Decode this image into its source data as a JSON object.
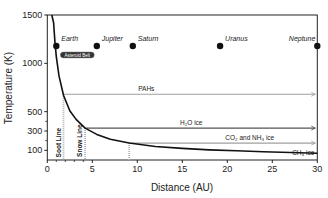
{
  "chart_data": {
    "type": "line",
    "title": "",
    "xlabel": "Distance (AU)",
    "ylabel": "Temperature (K)",
    "xlim": [
      0,
      30
    ],
    "ylim": [
      0,
      1500
    ],
    "x_ticks": [
      0,
      5,
      10,
      15,
      20,
      25,
      30
    ],
    "y_ticks": [
      100,
      300,
      500,
      1000,
      1500
    ],
    "y_tick_labels": [
      "100",
      "300",
      "500",
      "1000",
      "1500"
    ],
    "x_tick_labels": [
      "0",
      "5",
      "10",
      "15",
      "20",
      "25",
      "30"
    ],
    "grid": false,
    "series": [
      {
        "name": "Disk temperature profile",
        "x": [
          0.7,
          0.85,
          1,
          1.3,
          1.8,
          2.5,
          3.2,
          4.2,
          5.5,
          7,
          9.1,
          12,
          15,
          18,
          21,
          24,
          27,
          30
        ],
        "y": [
          1420,
          1220,
          1070,
          870,
          670,
          510,
          420,
          330,
          265,
          215,
          175,
          140,
          120,
          105,
          95,
          85,
          77,
          70
        ]
      }
    ],
    "planets": [
      {
        "name": "Earth",
        "distance": 1.0,
        "temperature": 1180
      },
      {
        "name": "Jupiter",
        "distance": 5.5,
        "temperature": 1180
      },
      {
        "name": "Saturn",
        "distance": 9.5,
        "temperature": 1180
      },
      {
        "name": "Uranus",
        "distance": 19.2,
        "temperature": 1180
      },
      {
        "name": "Neptune",
        "distance": 30.0,
        "temperature": 1180
      }
    ],
    "asteroid_belt_label": "Asteroid Belt",
    "condensation_zones": [
      {
        "label": "PAHs",
        "start_distance": 1.8,
        "temperature": 680,
        "color": "#a0a0a0"
      },
      {
        "label": "H₂O ice",
        "start_distance": 4.2,
        "temperature": 330,
        "color": "#555555"
      },
      {
        "label": "CO₂ and NH₃ ice",
        "start_distance": 9.1,
        "temperature": 175,
        "color": "#a0a0a0"
      },
      {
        "label": "CH₄ ice",
        "start_distance": 29.0,
        "temperature": 20,
        "color": "#555555"
      }
    ],
    "vertical_lines": [
      {
        "label": "Soot Line",
        "distance": 1.8
      },
      {
        "label": "Snow Line",
        "distance": 4.2
      },
      {
        "label": "",
        "distance": 9.1
      }
    ]
  }
}
